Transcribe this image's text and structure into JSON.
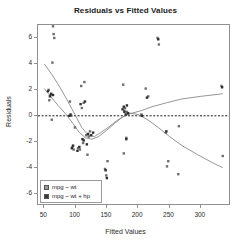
{
  "chart_data": {
    "type": "scatter",
    "title": "Residuals vs Fitted Values",
    "xlabel": "Fitted Values",
    "ylabel": "Residuals",
    "xlim": [
      40,
      345
    ],
    "ylim": [
      -6.8,
      7.0
    ],
    "xticks": [
      50,
      100,
      150,
      200,
      250,
      300
    ],
    "yticks": [
      6,
      4,
      2,
      0,
      -2,
      -4,
      -6
    ],
    "grid": false,
    "legend_position": "bottom-left",
    "reference_line": {
      "y": 0,
      "style": "dashed",
      "color": "#1a1a1a"
    },
    "series": [
      {
        "name": "mpg ~ wt",
        "color": "#6e6e6e",
        "marker": "square",
        "points": [
          [
            57,
            2.0
          ],
          [
            58,
            1.2
          ],
          [
            60,
            1.6
          ],
          [
            62,
            -0.3
          ],
          [
            63,
            4.1
          ],
          [
            64,
            6.9
          ],
          [
            65,
            6.3
          ],
          [
            66,
            6.0
          ],
          [
            91,
            1.1
          ],
          [
            93,
            0.0
          ],
          [
            95,
            -2.4
          ],
          [
            97,
            -2.6
          ],
          [
            99,
            -0.9
          ],
          [
            104,
            -2.5
          ],
          [
            107,
            -2.6
          ],
          [
            109,
            2.3
          ],
          [
            110,
            0.6
          ],
          [
            112,
            -2.1
          ],
          [
            113,
            1.0
          ],
          [
            114,
            2.6
          ],
          [
            117,
            -1.5
          ],
          [
            119,
            -3.0
          ],
          [
            121,
            -1.6
          ],
          [
            123,
            -1.2
          ],
          [
            147,
            -4.1
          ],
          [
            149,
            -4.6
          ],
          [
            151,
            -3.5
          ],
          [
            176,
            2.4
          ],
          [
            177,
            -2.9
          ],
          [
            178,
            0.4
          ],
          [
            179,
            0.6
          ],
          [
            181,
            -1.7
          ],
          [
            182,
            0.3
          ],
          [
            183,
            0.2
          ],
          [
            205,
            0.1
          ],
          [
            212,
            2.1
          ],
          [
            216,
            1.5
          ],
          [
            231,
            6.0
          ],
          [
            233,
            5.5
          ],
          [
            244,
            -1.3
          ],
          [
            246,
            -3.9
          ],
          [
            248,
            -3.5
          ],
          [
            264,
            -4.5
          ],
          [
            265,
            -0.8
          ],
          [
            333,
            2.3
          ],
          [
            335,
            -3.1
          ]
        ]
      },
      {
        "name": "mpg ~ wt + hp",
        "color": "#2f2f2f",
        "marker": "square",
        "points": [
          [
            56,
            1.9
          ],
          [
            59,
            1.5
          ],
          [
            61,
            1.7
          ],
          [
            64,
            1.6
          ],
          [
            90,
            0.0
          ],
          [
            92,
            0.1
          ],
          [
            94,
            -2.5
          ],
          [
            96,
            -2.3
          ],
          [
            103,
            -2.7
          ],
          [
            106,
            -2.4
          ],
          [
            108,
            0.9
          ],
          [
            111,
            -1.8
          ],
          [
            113,
            -1.9
          ],
          [
            115,
            1.1
          ],
          [
            118,
            -2.2
          ],
          [
            120,
            -1.4
          ],
          [
            125,
            -1.5
          ],
          [
            128,
            -1.3
          ],
          [
            148,
            -4.2
          ],
          [
            150,
            -4.8
          ],
          [
            175,
            0.5
          ],
          [
            177,
            0.7
          ],
          [
            178,
            0.3
          ],
          [
            180,
            0.1
          ],
          [
            181,
            -1.8
          ],
          [
            182,
            0.8
          ],
          [
            184,
            0.2
          ],
          [
            206,
            0.0
          ],
          [
            214,
            1.4
          ],
          [
            232,
            5.9
          ],
          [
            245,
            -1.2
          ],
          [
            334,
            2.2
          ]
        ]
      }
    ],
    "smooth_curves": [
      {
        "name": "mpg ~ wt smooth",
        "color": "#8a8a8a",
        "points": [
          [
            50,
            4.0
          ],
          [
            62,
            3.2
          ],
          [
            75,
            2.2
          ],
          [
            88,
            1.1
          ],
          [
            100,
            0.0
          ],
          [
            110,
            -0.9
          ],
          [
            120,
            -1.5
          ],
          [
            130,
            -1.6
          ],
          [
            140,
            -1.3
          ],
          [
            152,
            -0.9
          ],
          [
            165,
            -0.4
          ],
          [
            178,
            0.0
          ],
          [
            190,
            0.2
          ],
          [
            205,
            0.4
          ],
          [
            222,
            0.7
          ],
          [
            245,
            1.0
          ],
          [
            270,
            1.3
          ],
          [
            300,
            1.5
          ],
          [
            335,
            1.7
          ]
        ]
      },
      {
        "name": "mpg ~ wt + hp smooth",
        "color": "#8a8a8a",
        "points": [
          [
            50,
            2.1
          ],
          [
            60,
            1.5
          ],
          [
            72,
            0.8
          ],
          [
            85,
            0.1
          ],
          [
            96,
            -0.6
          ],
          [
            106,
            -1.3
          ],
          [
            116,
            -1.7
          ],
          [
            126,
            -1.8
          ],
          [
            137,
            -1.6
          ],
          [
            150,
            -1.1
          ],
          [
            162,
            -0.6
          ],
          [
            175,
            -0.1
          ],
          [
            188,
            0.2
          ],
          [
            200,
            0.1
          ],
          [
            215,
            -0.3
          ],
          [
            232,
            -0.9
          ],
          [
            250,
            -1.6
          ],
          [
            270,
            -2.3
          ],
          [
            295,
            -3.0
          ],
          [
            318,
            -3.6
          ],
          [
            335,
            -4.0
          ]
        ]
      }
    ]
  },
  "legend": {
    "items": [
      {
        "label": "mpg ~ wt",
        "color": "#9a9a9a"
      },
      {
        "label": "mpg ~ wt + hp",
        "color": "#3a3a3a"
      }
    ]
  }
}
